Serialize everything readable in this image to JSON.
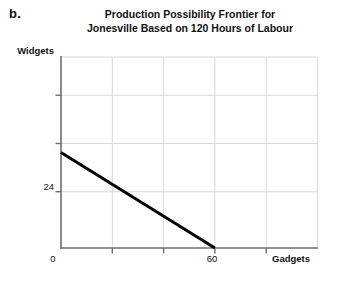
{
  "part_label": "b.",
  "title_lines": [
    "Production Possibility Frontier for",
    "Jonesville Based on 120 Hours of Labour"
  ],
  "axes": {
    "ylabel": "Widgets",
    "xlabel": "Gadgets",
    "origin_label": "0",
    "ytick_24": "24",
    "xtick_60": "60"
  },
  "colors": {
    "line": "#000000",
    "axis": "#6e6e6e",
    "grid": "#d6d6d6",
    "text": "#111111",
    "background": "#ffffff"
  },
  "chart_data": {
    "type": "line",
    "title": "Production Possibility Frontier for Jonesville Based on 120 Hours of Labour",
    "xlabel": "Gadgets",
    "ylabel": "Widgets",
    "xlim": [
      0,
      100
    ],
    "ylim": [
      0,
      48
    ],
    "xticks": [
      0,
      20,
      40,
      60,
      80,
      100
    ],
    "xtick_labels": [
      "0",
      "",
      "",
      "60",
      "",
      ""
    ],
    "yticks": [
      0,
      12,
      24,
      36,
      48
    ],
    "ytick_labels": [
      "",
      "",
      "24",
      "",
      ""
    ],
    "grid": true,
    "legend": false,
    "series": [
      {
        "name": "Production Possibility Frontier",
        "x": [
          0,
          60
        ],
        "y": [
          24,
          0
        ],
        "color": "#000000",
        "linewidth": 3
      }
    ],
    "annotations": [
      {
        "text": "24",
        "x": 0,
        "y": 24,
        "position": "y-axis-tick"
      },
      {
        "text": "60",
        "x": 60,
        "y": 0,
        "position": "x-axis-tick"
      },
      {
        "text": "0",
        "x": 0,
        "y": 0,
        "position": "origin"
      }
    ]
  }
}
